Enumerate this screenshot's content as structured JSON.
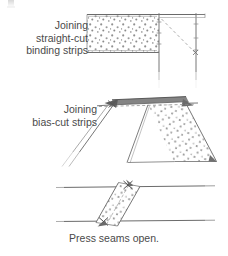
{
  "figure": {
    "ink_color": "#555555",
    "fabric_dot_color": "#8f8f8f",
    "background": "#ffffff"
  },
  "sections": [
    {
      "id": "straight-cut",
      "label_lines": [
        "Joining",
        "straight-cut",
        "binding strips"
      ],
      "diagram_name": "straight-cut-binding-join-diagram",
      "description": "Two straight-cut binding strips overlapped at right angles; speckled fabric rectangle on left joined to a plain vertical strip on the right with a diagonal stitching line marked inside the corner."
    },
    {
      "id": "bias-cut",
      "label_lines": [
        "Joining",
        "bias-cut strips"
      ],
      "diagram_name": "bias-cut-strip-join-diagram",
      "description": "Two bias-cut strips meeting in a peak; the small dark seam allowance tips extend beyond the dashed seam line at the apex, speckled fabric on the right strip."
    },
    {
      "id": "press-seams",
      "label_lines": [
        "Press seams open."
      ],
      "diagram_name": "pressed-open-diagonal-seam-diagram",
      "description": "A diagonal speckled strip crossing between two horizontal fabric edges with the seam pressed open and small cross marks at each end of the seam."
    }
  ],
  "corner_mark": {
    "name": "page-corner-artifact",
    "visible": true
  }
}
